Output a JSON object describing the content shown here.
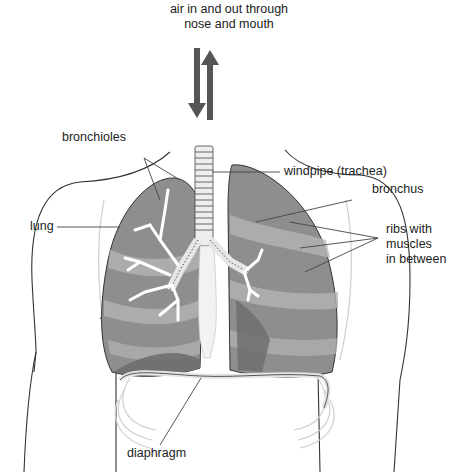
{
  "diagram": {
    "colors": {
      "lung_fill": "#8e8e8e",
      "lung_light": "#b4b4b4",
      "lung_dark": "#6e6e6e",
      "outline": "#333333",
      "arrow": "#555555",
      "trachea": "#e6e6e6",
      "ribs": "#d0d0d0",
      "leader": "#444444"
    },
    "labels": {
      "air_line1": "air in and out through",
      "air_line2": "nose and mouth",
      "bronchioles": "bronchioles",
      "windpipe": "windpipe (trachea)",
      "bronchus": "bronchus",
      "ribs_line1": "ribs with",
      "ribs_line2": "muscles",
      "ribs_line3": "in between",
      "lung": "lung",
      "diaphragm": "diaphragm"
    },
    "arrows": [
      {
        "name": "air-in-arrow",
        "direction": "down"
      },
      {
        "name": "air-out-arrow",
        "direction": "up"
      }
    ]
  }
}
